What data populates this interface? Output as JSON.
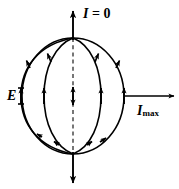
{
  "figure": {
    "background_color": "#ffffff",
    "stroke_color": "#000000"
  },
  "labels": {
    "top": {
      "symbol": "I",
      "equals": " = 0",
      "full_text": "I = 0",
      "name": "current-zero-label"
    },
    "right": {
      "symbol": "I",
      "subscript": "max",
      "full_text": "I max",
      "name": "current-max-label"
    },
    "left": {
      "symbol": "E",
      "full_text": "E",
      "name": "electric-field-label"
    }
  },
  "geometry": {
    "sphere": {
      "center_x": 73,
      "center_y": 96,
      "radius_x": 51,
      "radius_y": 58
    },
    "axis": {
      "style": "dashed",
      "top_y": 38,
      "bottom_y": 154
    },
    "meridian_equator_x": [
      21,
      44,
      73,
      101,
      124
    ],
    "arrows": {
      "top_axis": {
        "direction": "up",
        "tip_y": 9
      },
      "bottom_axis": {
        "direction": "down",
        "tip_y": 185
      },
      "right_horizontal": {
        "direction": "right",
        "start_x": 124,
        "tip_x": 176,
        "y": 96
      },
      "center_double": {
        "direction": "both",
        "x": 73,
        "y": 96
      }
    }
  }
}
